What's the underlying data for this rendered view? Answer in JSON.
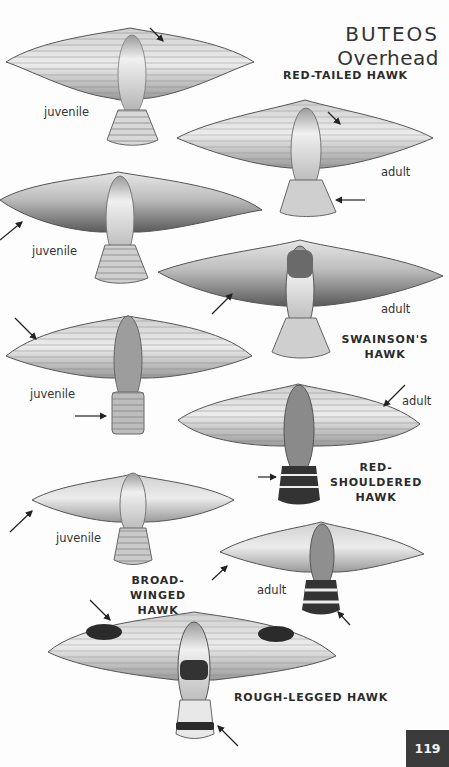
{
  "page": {
    "title_line1": "BUTEOS",
    "title_line2": "Overhead",
    "page_number": "119"
  },
  "species": [
    {
      "id": "red-tailed",
      "name_line1": "RED-TAILED HAWK",
      "name_line2": "",
      "plates": [
        {
          "age": "juvenile"
        },
        {
          "age": "adult"
        }
      ]
    },
    {
      "id": "swainsons",
      "name_line1": "SWAINSON'S",
      "name_line2": "HAWK",
      "plates": [
        {
          "age": "juvenile"
        },
        {
          "age": "adult"
        }
      ]
    },
    {
      "id": "red-shouldered",
      "name_line1": "RED-SHOULDERED",
      "name_line2": "HAWK",
      "plates": [
        {
          "age": "juvenile"
        },
        {
          "age": "adult"
        }
      ]
    },
    {
      "id": "broad-winged",
      "name_line1": "BROAD-WINGED",
      "name_line2": "HAWK",
      "plates": [
        {
          "age": "juvenile"
        },
        {
          "age": "adult"
        }
      ]
    },
    {
      "id": "rough-legged",
      "name_line1": "ROUGH-LEGGED HAWK",
      "name_line2": "",
      "plates": []
    }
  ],
  "colors": {
    "page_bg": "#fdfdfd",
    "ink": "#2a2a2a",
    "page_tab": "#3b3b3b",
    "wing_light": "#e4e4e4",
    "wing_dark": "#555555"
  }
}
